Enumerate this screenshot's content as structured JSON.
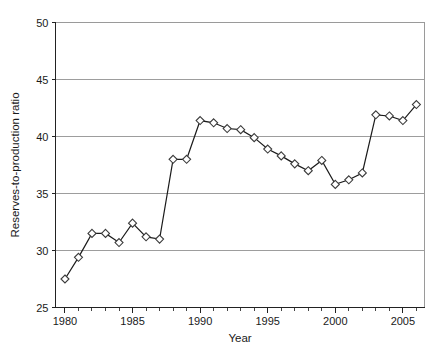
{
  "chart_data": {
    "type": "line",
    "title": "",
    "xlabel": "Year",
    "ylabel": "Reserves-to-production ratio",
    "xlim": [
      1979.2,
      1986.0
    ],
    "ylim": [
      25,
      50
    ],
    "xticks": [
      1980,
      1985,
      1990,
      1995,
      2000,
      2005
    ],
    "xtick_labels": [
      "1980",
      "1985",
      "1990",
      "1995",
      "2000",
      "2005"
    ],
    "yticks": [
      25,
      30,
      35,
      40,
      45,
      50
    ],
    "ytick_labels": [
      "25",
      "30",
      "35",
      "40",
      "45",
      "50"
    ],
    "x_minor_tick_step": 1,
    "grid": "horizontal",
    "legend": "none",
    "marker": "diamond-open",
    "line_color": "#1b1b1b",
    "marker_face_color": "#ffffff",
    "marker_edge_color": "#3a3a3a",
    "grid_color": "#9d9d9d",
    "axis_color": "#222222",
    "x": [
      1980,
      1981,
      1982,
      1983,
      1984,
      1985,
      1986,
      1987,
      1988,
      1989,
      1990,
      1991,
      1992,
      1993,
      1994,
      1995,
      1996,
      1997,
      1998,
      1999,
      2000,
      2001,
      2002,
      2003,
      2004,
      2005,
      2006
    ],
    "values": [
      27.5,
      29.4,
      31.5,
      31.5,
      30.7,
      32.4,
      31.2,
      31.0,
      38.0,
      38.0,
      41.4,
      41.2,
      40.7,
      40.6,
      39.9,
      38.9,
      38.3,
      37.6,
      37.0,
      37.9,
      35.8,
      36.2,
      36.8,
      41.9,
      41.8,
      41.4,
      42.8
    ],
    "series": [
      {
        "name": "Reserves-to-production ratio",
        "values": [
          27.5,
          29.4,
          31.5,
          31.5,
          30.7,
          32.4,
          31.2,
          31.0,
          38.0,
          38.0,
          41.4,
          41.2,
          40.7,
          40.6,
          39.9,
          38.9,
          38.3,
          37.6,
          37.0,
          37.9,
          35.8,
          36.2,
          36.8,
          41.9,
          41.8,
          41.4,
          42.8
        ]
      }
    ]
  }
}
